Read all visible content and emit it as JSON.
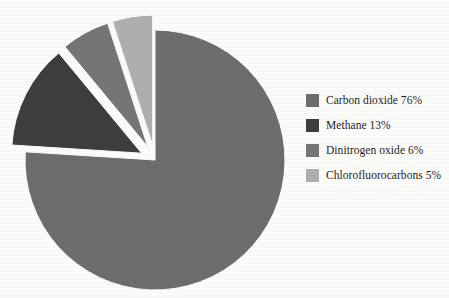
{
  "chart_data": {
    "type": "pie",
    "title": "",
    "labels": [
      "Carbon dioxide",
      "Methane",
      "Dinitrogen oxide",
      "Chlorofluorocarbons"
    ],
    "values": [
      76,
      13,
      6,
      5
    ],
    "unit": "%",
    "legend_position": "right",
    "grid": false,
    "start_angle_deg": 0,
    "direction": "clockwise",
    "slices": [
      {
        "label": "Carbon dioxide",
        "value": 76,
        "legend_text": "Carbon dioxide 76%",
        "color": "#6e6e6e",
        "exploded": false
      },
      {
        "label": "Methane",
        "value": 13,
        "legend_text": "Methane 13%",
        "color": "#3e3e3e",
        "exploded": true
      },
      {
        "label": "Dinitrogen oxide",
        "value": 6,
        "legend_text": "Dinitrogen oxide 6%",
        "color": "#767676",
        "exploded": true
      },
      {
        "label": "Chlorofluorocarbons",
        "value": 5,
        "legend_text": "Chlorofluorocarbons 5%",
        "color": "#b0b0b0",
        "exploded": true
      }
    ]
  },
  "legend": {
    "items": [
      {
        "label": "Carbon dioxide 76%",
        "color": "#6e6e6e"
      },
      {
        "label": "Methane 13%",
        "color": "#3e3e3e"
      },
      {
        "label": "Dinitrogen oxide 6%",
        "color": "#767676"
      },
      {
        "label": "Chlorofluorocarbons 5%",
        "color": "#b0b0b0"
      }
    ]
  },
  "canvas": {
    "background": "#fdfdfb",
    "center_x": 155,
    "center_y": 160,
    "radius": 130,
    "explode_offset": 15
  }
}
